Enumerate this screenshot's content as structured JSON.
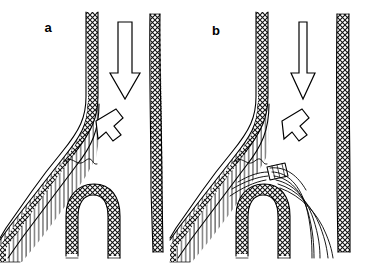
{
  "figure": {
    "background_color": "#ffffff",
    "ink_color": "#000000",
    "width": 371,
    "height": 266
  },
  "panels": [
    {
      "id": "a",
      "label": "a",
      "label_x": 48,
      "label_y": 32,
      "description": "Bifurcation with flow arrows, no device",
      "arrows": [
        {
          "name": "main-flow-arrow",
          "direction": "down",
          "x": 124,
          "y": 22,
          "length": 70
        },
        {
          "name": "branch-flow-arrow",
          "direction": "down-left",
          "x": 92,
          "y": 115
        }
      ],
      "features": [
        {
          "name": "main-vessel-wall-left",
          "pattern": "cross-hatch"
        },
        {
          "name": "main-vessel-wall-right",
          "pattern": "cross-hatch"
        },
        {
          "name": "branch-vessel",
          "pattern": "line-hatch"
        },
        {
          "name": "arch-vessel",
          "pattern": "cross-hatch"
        },
        {
          "name": "intimal-flap-squiggle",
          "pattern": "wavy-line"
        }
      ]
    },
    {
      "id": "b",
      "label": "b",
      "label_x": 216,
      "label_y": 35,
      "description": "Same bifurcation with deployed device and curved wire filaments",
      "arrows": [
        {
          "name": "main-flow-arrow",
          "direction": "down",
          "x": 303,
          "y": 22,
          "length": 70
        },
        {
          "name": "branch-flow-arrow",
          "direction": "down-left",
          "x": 278,
          "y": 115
        }
      ],
      "features": [
        {
          "name": "main-vessel-wall-left",
          "pattern": "cross-hatch"
        },
        {
          "name": "main-vessel-wall-right",
          "pattern": "cross-hatch"
        },
        {
          "name": "branch-vessel",
          "pattern": "line-hatch"
        },
        {
          "name": "arch-vessel",
          "pattern": "cross-hatch"
        },
        {
          "name": "intimal-flap-squiggle",
          "pattern": "wavy-line"
        },
        {
          "name": "device-hub",
          "pattern": "small-cylinder"
        },
        {
          "name": "wire-filaments",
          "count": 5,
          "pattern": "curved-lines"
        }
      ]
    }
  ],
  "legend": {
    "cross_hatch_meaning": "vessel wall",
    "line_hatch_meaning": "branch lumen",
    "arrow_meaning": "blood flow direction"
  }
}
